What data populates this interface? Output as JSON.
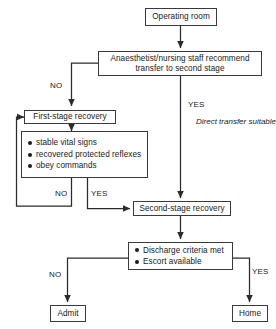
{
  "diagram": {
    "type": "flowchart",
    "line_color": "#3a3a3a",
    "text_color": "#1a1a1a",
    "background": "#ffffff"
  },
  "nodes": {
    "operating_room": {
      "label": "Operating room"
    },
    "anaesthetist": {
      "line1": "Anaesthetist/nursing staff recommend",
      "line2": "transfer to second stage"
    },
    "first_stage": {
      "label": "First-stage recovery"
    },
    "first_stage_criteria": {
      "items": [
        "stable vital signs",
        "recovered protected reflexes",
        "obey commands"
      ]
    },
    "second_stage": {
      "label": "Second-stage recovery"
    },
    "discharge_criteria": {
      "items": [
        "Discharge criteria met",
        "Escort available"
      ]
    },
    "admit": {
      "label": "Admit"
    },
    "home": {
      "label": "Home"
    }
  },
  "edge_labels": {
    "anaesthetist_no": "NO",
    "anaesthetist_yes": "YES",
    "criteria_no": "NO",
    "criteria_yes": "YES",
    "discharge_no": "NO",
    "discharge_yes": "YES"
  },
  "notes": {
    "direct_transfer": {
      "line1": "Direct transfer",
      "line2": "suitable for",
      "line3": "selected patients"
    }
  }
}
